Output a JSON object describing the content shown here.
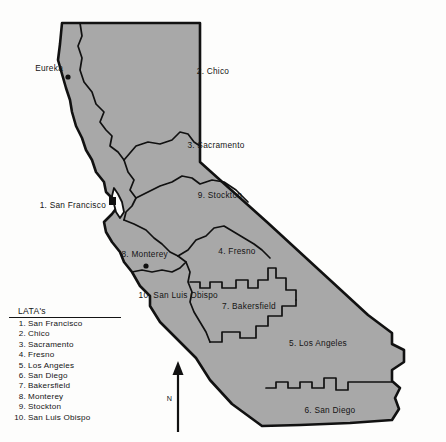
{
  "map": {
    "title": "California LATA Map",
    "colors": {
      "land_fill": "#a8a8a8",
      "outline": "#111111",
      "boundary": "#111111",
      "background": "#fdfdfc",
      "text": "#141414"
    },
    "lata_labels": [
      {
        "id": "chico",
        "text": "2. Chico",
        "x": 213,
        "y": 74
      },
      {
        "id": "sacramento",
        "text": "3. Sacramento",
        "x": 216,
        "y": 148
      },
      {
        "id": "stockton",
        "text": "9. Stockton",
        "x": 220,
        "y": 198
      },
      {
        "id": "fresno",
        "text": "4. Fresno",
        "x": 237,
        "y": 254
      },
      {
        "id": "bakersfield",
        "text": "7. Bakersfield",
        "x": 249,
        "y": 309
      },
      {
        "id": "los-angeles",
        "text": "5. Los Angeles",
        "x": 318,
        "y": 346
      },
      {
        "id": "san-diego",
        "text": "6. San Diego",
        "x": 330,
        "y": 413
      },
      {
        "id": "san-francisco",
        "text": "1. San Francisco",
        "x": 88,
        "y": 208,
        "anchor": "end"
      },
      {
        "id": "monterey",
        "text": "8. Monterey",
        "x": 168,
        "y": 257,
        "anchor": "end"
      },
      {
        "id": "san-luis-obispo",
        "text": "10. San Luis Obispo",
        "x": 218,
        "y": 298,
        "anchor": "end"
      }
    ],
    "city_labels": [
      {
        "id": "eureka",
        "text": "Eureka",
        "x": 63,
        "y": 71,
        "anchor": "end"
      }
    ],
    "city_markers": [
      {
        "id": "eureka-marker",
        "shape": "dot",
        "x": 68,
        "y": 77,
        "r": 2.6
      },
      {
        "id": "monterey-marker",
        "shape": "dot",
        "x": 146,
        "y": 266,
        "r": 2.6
      }
    ],
    "bay_marker": {
      "id": "san-francisco-marker",
      "shape": "square",
      "x": 112,
      "y": 200,
      "w": 7,
      "h": 8
    },
    "compass": {
      "label": "N",
      "x": 178,
      "top": 363,
      "bottom": 432,
      "label_x": 173,
      "label_y": 400
    }
  },
  "legend": {
    "title": "LATA's",
    "items": [
      {
        "num": "1.",
        "name": "San Francisco"
      },
      {
        "num": "2.",
        "name": "Chico"
      },
      {
        "num": "3.",
        "name": "Sacramento"
      },
      {
        "num": "4.",
        "name": "Fresno"
      },
      {
        "num": "5.",
        "name": "Los Angeles"
      },
      {
        "num": "6.",
        "name": "San Diego"
      },
      {
        "num": "7.",
        "name": "Bakersfield"
      },
      {
        "num": "8.",
        "name": "Monterey"
      },
      {
        "num": "9.",
        "name": "Stockton"
      },
      {
        "num": "10.",
        "name": "San Luis Obispo"
      }
    ]
  }
}
